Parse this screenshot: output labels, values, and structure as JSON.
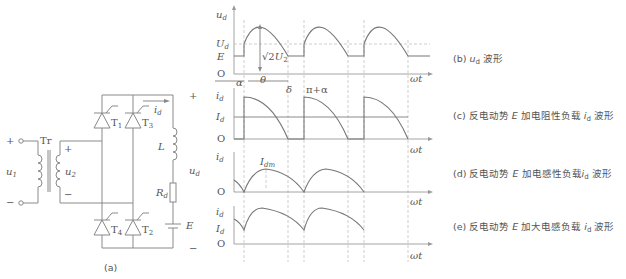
{
  "circuit": {
    "caption": "(a)",
    "input_voltage": "u1",
    "transformer": "Tr",
    "secondary_voltage": "u2",
    "thyristors": [
      "T1",
      "T3",
      "T4",
      "T2"
    ],
    "current": "id",
    "inductor": "L",
    "resistor": "Rd",
    "emf": "E",
    "output_voltage": "ud",
    "plus": "+",
    "minus": "−"
  },
  "waveforms": [
    {
      "id": "b",
      "y_label": "ud",
      "levels": [
        "Ud",
        "E",
        "O"
      ],
      "annotations": [
        "√2U2",
        "α",
        "θ",
        "δ",
        "π+α"
      ],
      "x_label": "ωt",
      "caption": "(b) ud 波形"
    },
    {
      "id": "c",
      "y_label": "id",
      "levels": [
        "Id",
        "O"
      ],
      "x_label": "ωt",
      "caption": "(c) 反电动势 E 加电阻性负载 id 波形"
    },
    {
      "id": "d",
      "y_label": "id",
      "annotations": [
        "Idm"
      ],
      "levels": [
        "O"
      ],
      "x_label": "ωt",
      "caption": "(d) 反电动势 E 加电感性负载 id 波形"
    },
    {
      "id": "e",
      "y_label": "id",
      "levels": [
        "Id",
        "O"
      ],
      "x_label": "ωt",
      "caption": "(e) 反电动势 E 加大电感负载 id 波形"
    }
  ]
}
